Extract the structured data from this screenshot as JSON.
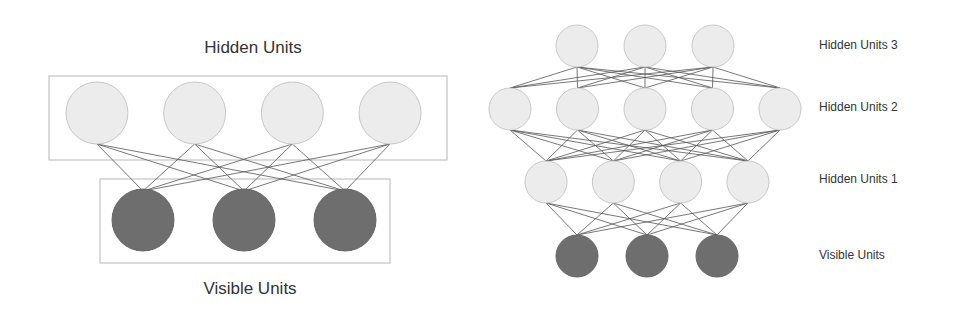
{
  "colors": {
    "hidden_fill": "#ececec",
    "hidden_stroke": "#c8c8c8",
    "visible_fill": "#6e6e6e",
    "visible_stroke": "#666666",
    "edge": "#555555",
    "box": "#b8b8b8",
    "text": "#333333"
  },
  "rbm": {
    "title_hidden": "Hidden Units",
    "title_visible": "Visible Units",
    "hidden_count": 4,
    "visible_count": 3
  },
  "dbn": {
    "layers": [
      {
        "label": "Hidden Units 3",
        "count": 3,
        "type": "hidden"
      },
      {
        "label": "Hidden Units 2",
        "count": 5,
        "type": "hidden"
      },
      {
        "label": "Hidden Units 1",
        "count": 4,
        "type": "hidden"
      },
      {
        "label": "Visible Units",
        "count": 3,
        "type": "visible"
      }
    ]
  }
}
